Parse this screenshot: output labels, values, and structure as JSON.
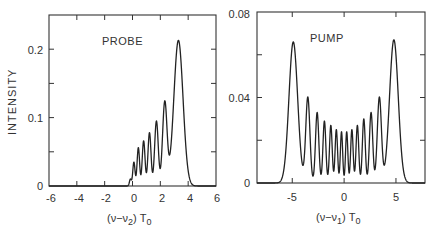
{
  "chart_data": [
    {
      "type": "line",
      "title": "PROBE",
      "xlabel": "(ν−ν2) T0",
      "ylabel": "INTENSITY",
      "xlim": [
        -6,
        6
      ],
      "ylim": [
        0,
        0.25
      ],
      "xticks": [
        -6,
        -4,
        -2,
        0,
        2,
        4,
        6
      ],
      "xtick_labels": [
        "-6",
        "-4",
        "-2",
        "0",
        "2",
        "4",
        "6"
      ],
      "yticks": [
        0,
        0.1,
        0.2
      ],
      "ytick_labels": [
        "0",
        "0.1",
        "0.2"
      ],
      "grid": false,
      "peaks": [
        {
          "x": -0.15,
          "y": 0.01,
          "w": 0.07
        },
        {
          "x": 0.1,
          "y": 0.035,
          "w": 0.08
        },
        {
          "x": 0.42,
          "y": 0.056,
          "w": 0.09
        },
        {
          "x": 0.8,
          "y": 0.066,
          "w": 0.1
        },
        {
          "x": 1.22,
          "y": 0.078,
          "w": 0.11
        },
        {
          "x": 1.72,
          "y": 0.095,
          "w": 0.13
        },
        {
          "x": 2.32,
          "y": 0.122,
          "w": 0.16
        },
        {
          "x": 3.3,
          "y": 0.213,
          "w": 0.33
        }
      ]
    },
    {
      "type": "line",
      "title": "PUMP",
      "xlabel": "(ν−ν1) T0",
      "ylabel": "",
      "xlim": [
        -8.4,
        7.8
      ],
      "ylim": [
        0,
        0.08
      ],
      "xticks": [
        -5,
        0,
        5
      ],
      "xtick_labels": [
        "-5",
        "0",
        "5"
      ],
      "yticks": [
        0,
        0.04,
        0.08
      ],
      "ytick_labels": [
        "0",
        "0.04",
        "0.08"
      ],
      "grid": false,
      "peaks": [
        {
          "x": -4.9,
          "y": 0.066,
          "w": 0.42
        },
        {
          "x": -3.5,
          "y": 0.04,
          "w": 0.2
        },
        {
          "x": -2.6,
          "y": 0.033,
          "w": 0.16
        },
        {
          "x": -1.9,
          "y": 0.029,
          "w": 0.14
        },
        {
          "x": -1.28,
          "y": 0.027,
          "w": 0.13
        },
        {
          "x": -0.75,
          "y": 0.025,
          "w": 0.12
        },
        {
          "x": -0.25,
          "y": 0.024,
          "w": 0.11
        },
        {
          "x": 0.25,
          "y": 0.024,
          "w": 0.11
        },
        {
          "x": 0.75,
          "y": 0.025,
          "w": 0.12
        },
        {
          "x": 1.28,
          "y": 0.027,
          "w": 0.13
        },
        {
          "x": 1.9,
          "y": 0.03,
          "w": 0.14
        },
        {
          "x": 2.6,
          "y": 0.033,
          "w": 0.16
        },
        {
          "x": 3.4,
          "y": 0.04,
          "w": 0.2
        },
        {
          "x": 4.8,
          "y": 0.067,
          "w": 0.42
        }
      ]
    }
  ],
  "panels": {
    "probe": {
      "title": "PROBE",
      "ylabel": "INTENSITY",
      "xlabel_main": "(ν−ν",
      "xlabel_sub": "2",
      "xlabel_tail": ") T",
      "xlabel_sub2": "0",
      "xticks": [
        "-6",
        "-4",
        "-2",
        "0",
        "2",
        "4",
        "6"
      ],
      "yticks": [
        "0",
        "0.1",
        "0.2"
      ]
    },
    "pump": {
      "title": "PUMP",
      "xlabel_main": "(ν−ν",
      "xlabel_sub": "1",
      "xlabel_tail": ") T",
      "xlabel_sub2": "0",
      "xticks": [
        "-5",
        "0",
        "5"
      ],
      "yticks": [
        "0",
        "0.04",
        "0.08"
      ]
    }
  }
}
